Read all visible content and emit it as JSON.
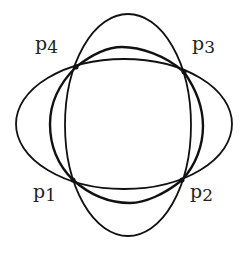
{
  "figure": {
    "curves": [
      {
        "name": "horizontal-ellipse",
        "cx": 124,
        "cy": 124,
        "rx": 108,
        "ry": 65
      },
      {
        "name": "vertical-ellipse",
        "cx": 128,
        "cy": 125,
        "rx": 63,
        "ry": 111
      },
      {
        "name": "middle-curve",
        "extent": {
          "left": 50,
          "right": 203,
          "top": 47,
          "bottom": 203
        }
      }
    ],
    "points": [
      {
        "id": "p1",
        "base": "p",
        "sub": "1",
        "x": 73,
        "y": 180
      },
      {
        "id": "p2",
        "base": "p",
        "sub": "2",
        "x": 182,
        "y": 180
      },
      {
        "id": "p3",
        "base": "p",
        "sub": "3",
        "x": 184,
        "y": 72
      },
      {
        "id": "p4",
        "base": "p",
        "sub": "4",
        "x": 76,
        "y": 67
      }
    ]
  }
}
